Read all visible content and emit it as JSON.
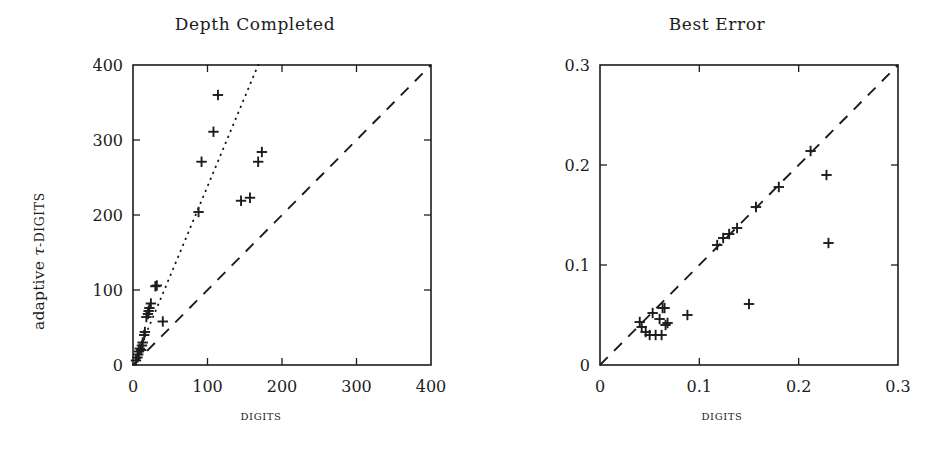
{
  "figure": {
    "panels": [
      {
        "id": "depth-completed",
        "title": "Depth Completed",
        "xlabel": "DIGITS",
        "ylabel_prefix": "adaptive ",
        "ylabel_tau": "τ",
        "ylabel_suffix": "-DIGITS"
      },
      {
        "id": "best-error",
        "title": "Best Error",
        "xlabel": "DIGITS",
        "ylabel_prefix": "adaptive ",
        "ylabel_tau": "τ",
        "ylabel_suffix": "-DIGITS"
      }
    ]
  },
  "chart_data": [
    {
      "type": "scatter",
      "title": "Depth Completed",
      "xlabel": "DIGITS",
      "ylabel": "adaptive τ-DIGITS",
      "xlim": [
        0,
        400
      ],
      "ylim": [
        0,
        400
      ],
      "xticks": [
        0,
        100,
        200,
        300,
        400
      ],
      "yticks": [
        0,
        100,
        200,
        300,
        400
      ],
      "xticklabels": [
        "0",
        "100",
        "200",
        "300",
        "400"
      ],
      "yticklabels": [
        "0",
        "100",
        "200",
        "300",
        "400"
      ],
      "grid": false,
      "legend": "none",
      "marker": "plus",
      "points": [
        [
          4,
          6
        ],
        [
          6,
          10
        ],
        [
          7,
          14
        ],
        [
          8,
          18
        ],
        [
          9,
          22
        ],
        [
          11,
          20
        ],
        [
          12,
          26
        ],
        [
          13,
          30
        ],
        [
          15,
          40
        ],
        [
          16,
          44
        ],
        [
          18,
          64
        ],
        [
          20,
          68
        ],
        [
          21,
          72
        ],
        [
          22,
          76
        ],
        [
          24,
          82
        ],
        [
          30,
          105
        ],
        [
          32,
          106
        ],
        [
          40,
          58
        ],
        [
          88,
          204
        ],
        [
          92,
          271
        ],
        [
          108,
          311
        ],
        [
          114,
          360
        ],
        [
          145,
          219
        ],
        [
          157,
          223
        ],
        [
          168,
          271
        ],
        [
          173,
          284
        ]
      ],
      "reference_lines": [
        {
          "name": "identity",
          "style": "dashed",
          "from": [
            0,
            0
          ],
          "to": [
            400,
            400
          ]
        },
        {
          "name": "slope-ratio",
          "style": "dotted",
          "from": [
            0,
            0
          ],
          "to": [
            168,
            400
          ],
          "slope": 2.38
        }
      ]
    },
    {
      "type": "scatter",
      "title": "Best Error",
      "xlabel": "DIGITS",
      "ylabel": "adaptive τ-DIGITS",
      "xlim": [
        0,
        0.3
      ],
      "ylim": [
        0,
        0.3
      ],
      "xticks": [
        0,
        0.1,
        0.2,
        0.3
      ],
      "yticks": [
        0,
        0.1,
        0.2,
        0.3
      ],
      "xticklabels": [
        "0",
        "0.1",
        "0.2",
        "0.3"
      ],
      "yticklabels": [
        "0",
        "0.1",
        "0.2",
        "0.3"
      ],
      "grid": false,
      "legend": "none",
      "marker": "plus",
      "points": [
        [
          0.04,
          0.043
        ],
        [
          0.042,
          0.038
        ],
        [
          0.046,
          0.033
        ],
        [
          0.05,
          0.03
        ],
        [
          0.053,
          0.052
        ],
        [
          0.056,
          0.03
        ],
        [
          0.06,
          0.046
        ],
        [
          0.062,
          0.03
        ],
        [
          0.063,
          0.057
        ],
        [
          0.065,
          0.057
        ],
        [
          0.066,
          0.04
        ],
        [
          0.068,
          0.042
        ],
        [
          0.088,
          0.05
        ],
        [
          0.118,
          0.12
        ],
        [
          0.124,
          0.127
        ],
        [
          0.13,
          0.131
        ],
        [
          0.138,
          0.137
        ],
        [
          0.15,
          0.061
        ],
        [
          0.157,
          0.158
        ],
        [
          0.18,
          0.178
        ],
        [
          0.212,
          0.214
        ],
        [
          0.228,
          0.19
        ],
        [
          0.23,
          0.122
        ]
      ],
      "reference_lines": [
        {
          "name": "identity",
          "style": "dashed",
          "from": [
            0,
            0
          ],
          "to": [
            0.3,
            0.3
          ]
        }
      ]
    }
  ]
}
